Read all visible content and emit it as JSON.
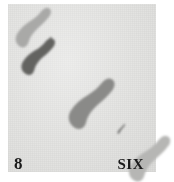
{
  "figure": {
    "background_color": "#ffffff",
    "panel_color": "#e3e3e1",
    "panel": {
      "x": 8,
      "y": 4,
      "width": 148,
      "height": 168
    }
  },
  "captions": {
    "left": "8",
    "right": "SIX"
  },
  "marks": [
    {
      "name": "shoe-sole-top-left-light",
      "tone": "light",
      "color": "#a9a9a7",
      "cx": 32,
      "cy": 27,
      "length": 52,
      "width": 20,
      "angle": -58
    },
    {
      "name": "sliver-upper",
      "tone": "dark",
      "color": "#6b6b69",
      "cx": 48,
      "cy": 41,
      "length": 11,
      "width": 3,
      "angle": -58
    },
    {
      "name": "shoe-sole-upper-dark",
      "tone": "dark",
      "color": "#636361",
      "cx": 37,
      "cy": 56,
      "length": 48,
      "width": 20,
      "angle": -58
    },
    {
      "name": "shoe-sole-center-mid",
      "tone": "mid",
      "color": "#8a8a88",
      "cx": 90,
      "cy": 103,
      "length": 66,
      "width": 27,
      "angle": -58
    },
    {
      "name": "sliver-lower",
      "tone": "dark",
      "color": "#6f6f6d",
      "cx": 121,
      "cy": 129,
      "length": 13,
      "width": 3,
      "angle": -58
    },
    {
      "name": "shoe-sole-bottom-right-light",
      "tone": "light",
      "color": "#b6b6b4",
      "cx": 148,
      "cy": 158,
      "length": 60,
      "width": 24,
      "angle": -58
    }
  ]
}
